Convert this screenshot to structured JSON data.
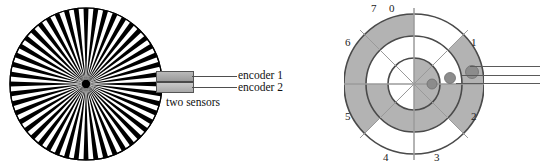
{
  "figure": {
    "background_color": "#ffffff"
  },
  "left_figure": {
    "name": "incremental-encoder",
    "disk": {
      "type": "incremental-striped-disk",
      "stripe_count": 48,
      "stripe_color": "#000000",
      "gap_color": "#ffffff",
      "hub_color": "#000000",
      "outline_color": "#000000"
    },
    "sensor_block": {
      "label": "two sensors",
      "fill_color": "#ababab",
      "outline_color": "#555555"
    },
    "leads": [
      {
        "label": "encoder 1"
      },
      {
        "label": "encoder 2"
      }
    ]
  },
  "right_figure": {
    "name": "absolute-encoder",
    "disk": {
      "type": "absolute-gray-code-disk",
      "track_count": 3,
      "sector_count": 8,
      "shaded_color": "#b3b3b3",
      "unshaded_color": "#ffffff",
      "outline_color": "#4a4a4a",
      "sector_labels": [
        "0",
        "1",
        "2",
        "3",
        "4",
        "5",
        "6",
        "7"
      ],
      "tracks": [
        {
          "name": "outer-track",
          "shaded_sectors": [
            1,
            2,
            5,
            6,
            7
          ]
        },
        {
          "name": "middle-track",
          "shaded_sectors": [
            2,
            3,
            4,
            5
          ]
        },
        {
          "name": "inner-track",
          "shaded_sectors": [
            0,
            1,
            2,
            3
          ]
        }
      ]
    },
    "sensors": [
      {
        "name": "inner-sensor",
        "color": "#8c8c8c"
      },
      {
        "name": "middle-sensor",
        "color": "#8c8c8c"
      },
      {
        "name": "outer-sensor",
        "color": "#8c8c8c"
      }
    ]
  }
}
